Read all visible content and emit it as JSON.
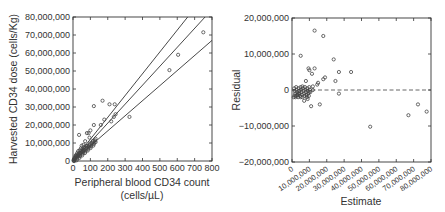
{
  "chart_data": [
    {
      "type": "scatter",
      "title": "",
      "xlabel": "Peripheral blood CD34 count",
      "xlabel_line2": "(cells/µL)",
      "ylabel": "Harvested CD34 dose (cells/Kg)",
      "xlim": [
        0,
        800
      ],
      "ylim": [
        0,
        80000000
      ],
      "xticks": [
        "0",
        "100",
        "200",
        "300",
        "400",
        "500",
        "600",
        "700",
        "800"
      ],
      "yticks": [
        "0",
        "10,000,000",
        "20,000,000",
        "30,000,000",
        "40,000,000",
        "50,000,000",
        "60,000,000",
        "70,000,000",
        "80,000,000"
      ],
      "grid": false,
      "lines": [
        {
          "name": "upper prediction bound",
          "x": [
            0,
            660
          ],
          "y": [
            0,
            80000000
          ]
        },
        {
          "name": "regression fit",
          "x": [
            0,
            760
          ],
          "y": [
            0,
            80000000
          ]
        },
        {
          "name": "lower prediction bound",
          "x": [
            0,
            800
          ],
          "y": [
            0,
            67000000
          ]
        }
      ],
      "points": {
        "x": [
          750,
          605,
          555,
          325,
          240,
          235,
          210,
          170,
          120,
          245,
          220,
          180,
          160,
          120,
          100,
          90,
          80,
          35,
          130,
          95,
          70,
          60,
          50,
          45,
          40,
          30,
          25,
          20,
          15,
          10,
          5,
          60,
          75,
          55,
          40,
          30,
          20,
          12,
          8,
          3
        ],
        "y": [
          71500000,
          59000000,
          50500000,
          24500000,
          31500000,
          24500000,
          31500000,
          33500000,
          30500000,
          26000000,
          22000000,
          23000000,
          20000000,
          20000000,
          17000000,
          15500000,
          15500000,
          14500000,
          10500000,
          13000000,
          11000000,
          9000000,
          8500000,
          7000000,
          6000000,
          5500000,
          4500000,
          3500000,
          3000000,
          2000000,
          1000000,
          7500000,
          8500000,
          6500000,
          4500000,
          3000000,
          2500000,
          1500000,
          800000,
          300000
        ]
      }
    },
    {
      "type": "scatter",
      "title": "",
      "xlabel": "Estimate",
      "ylabel": "Residual",
      "xlim": [
        0,
        80000000
      ],
      "ylim": [
        -20000000,
        20000000
      ],
      "xticks": [
        "0",
        "10,000,000",
        "20,000,000",
        "30,000,000",
        "40,000,000",
        "50,000,000",
        "60,000,000",
        "70,000,000",
        "80,000,000"
      ],
      "yticks": [
        "-20,000,000",
        "-10,000,000",
        "0",
        "10,000,000",
        "20,000,000"
      ],
      "grid": false,
      "reference_line": {
        "y": 0,
        "style": "dashed"
      },
      "points": {
        "x": [
          13000000,
          18000000,
          5000000,
          24000000,
          9500000,
          13000000,
          27000000,
          19000000,
          25000000,
          27000000,
          16000000,
          18000000,
          34000000,
          67000000,
          72500000,
          77500000,
          45000000,
          10000000,
          11500000,
          15000000,
          14500000,
          12000000,
          8000000,
          6000000,
          4000000,
          3000000,
          2000000,
          1500000,
          7000000,
          9000000,
          5000000,
          3500000,
          10000000,
          12000000,
          8500000,
          11000000
        ],
        "y": [
          16500000,
          15000000,
          9500000,
          8500000,
          6000000,
          6000000,
          5000000,
          3500000,
          2500000,
          -1000000,
          -4000000,
          3000000,
          5000000,
          -7000000,
          -4000000,
          -6000000,
          -10200000,
          5500000,
          4500000,
          2000000,
          1500000,
          1000000,
          2500000,
          1000000,
          -1000000,
          -1500000,
          -2000000,
          -1500000,
          -3000000,
          -2500000,
          -2000000,
          -1000000,
          -500000,
          0,
          -1500000,
          -4500000
        ]
      }
    }
  ],
  "left_chart": {
    "ylabel": "Harvested CD34 dose (cells/Kg)",
    "xlabel_line1": "Peripheral blood CD34 count",
    "xlabel_line2": "(cells/µL)",
    "yticks": [
      "0",
      "10,000,000",
      "20,000,000",
      "30,000,000",
      "40,000,000",
      "50,000,000",
      "60,000,000",
      "70,000,000",
      "80,000,000"
    ],
    "xticks": [
      "0",
      "100",
      "200",
      "300",
      "400",
      "500",
      "600",
      "700",
      "800"
    ]
  },
  "right_chart": {
    "ylabel": "Residual",
    "xlabel": "Estimate",
    "yticks": [
      "−20,000,000",
      "−10,000,000",
      "0",
      "10,000,000",
      "20,000,000"
    ],
    "xticks": [
      "0",
      "10,000,000",
      "20,000,000",
      "30,000,000",
      "40,000,000",
      "50,000,000",
      "60,000,000",
      "70,000,000",
      "80,000,000"
    ]
  }
}
